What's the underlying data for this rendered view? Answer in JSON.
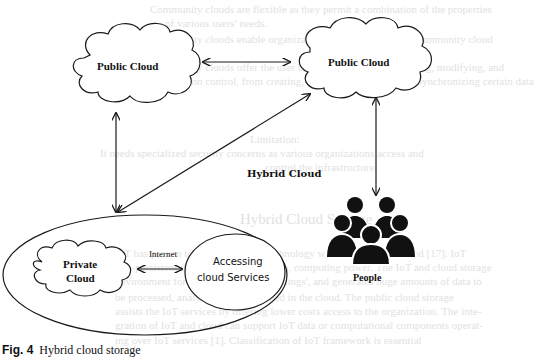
{
  "figure": {
    "caption_number": "Fig. 4",
    "caption_text": "Hybrid cloud storage"
  },
  "nodes": {
    "public_cloud_left": {
      "label": "Public Cloud"
    },
    "public_cloud_right": {
      "label": "Public Cloud"
    },
    "hybrid_cloud": {
      "label": "Hybrid Cloud"
    },
    "private_cloud": {
      "label_line1": "Private",
      "label_line2": "Cloud"
    },
    "accessing_services": {
      "label_line1": "Accessing",
      "label_line2": "cloud Services"
    },
    "people": {
      "label": "People"
    },
    "internet_link": {
      "label": "Internet"
    }
  },
  "edges": [
    {
      "from": "public_cloud_left",
      "to": "public_cloud_right",
      "type": "bidirectional"
    },
    {
      "from": "public_cloud_left",
      "to": "hybrid_cloud",
      "type": "bidirectional"
    },
    {
      "from": "public_cloud_right",
      "to": "hybrid_cloud",
      "type": "bidirectional"
    },
    {
      "from": "public_cloud_right",
      "to": "people",
      "type": "bidirectional"
    },
    {
      "from": "private_cloud",
      "to": "accessing_services",
      "type": "bidirectional",
      "label": "Internet"
    }
  ],
  "bleed_through_text": [
    "Community clouds are flexible as they permit a combination of the properties",
    "of various users' needs.",
    "Community clouds enable organizations to interact with the community cloud",
    "Community clouds offer the user block facility, such as deleting, modifying, and",
    "version control, from creating, deleting, modifying, and synchronizing certain data",
    "Limitation:",
    "It needs specialized security concerns as various organizations access and",
    "control the infrastructure.",
    "Hybrid Cloud Storage",
    "IoT has proven to be an emerging technology which is found in Cloud [17]. IoT",
    "non-persistent data, telecommunication, computing power. The IoT and cloud storage",
    "environment for devices, referred as 'things', and generates huge amounts of data to",
    "be processed, analyzed, and consumed in the cloud. The public cloud storage",
    "assists the IoT services by offering lower costs access to the organization. The inte-",
    "gration of IoT and cloud can support IoT data or computational components operat-",
    "ing over IoT services [1]. Classification of IoT framework is essential"
  ],
  "colors": {
    "stroke": "#1a1a1a",
    "fill_people": "#111111",
    "background": "#ffffff",
    "bleed_text": "#c9c9c9"
  }
}
